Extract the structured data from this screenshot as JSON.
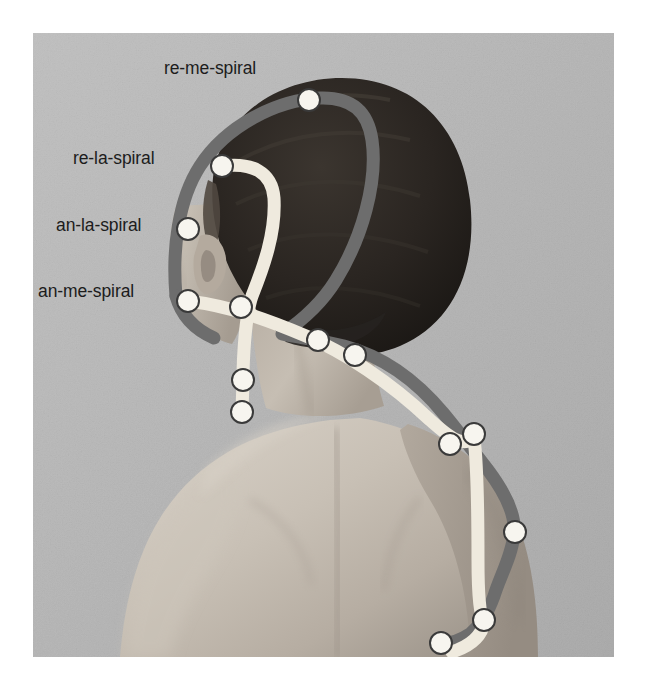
{
  "figure": {
    "kind": "annotated-photograph",
    "canvas": {
      "width": 647,
      "height": 687,
      "page_background": "#ffffff"
    },
    "photo": {
      "x": 33,
      "y": 33,
      "width": 581,
      "height": 624,
      "background_color": "#b9b9b9",
      "skin_color": "#c9c2b9",
      "hair_color": "#2a2622"
    },
    "labels": [
      {
        "id": "re-me-spiral",
        "text": "re-me-spiral",
        "x": 164,
        "y": 60,
        "anchor_dot": 0
      },
      {
        "id": "re-la-spiral",
        "text": "re-la-spiral",
        "x": 73,
        "y": 150,
        "anchor_dot": 1
      },
      {
        "id": "an-la-spiral",
        "text": "an-la-spiral",
        "x": 56,
        "y": 217,
        "anchor_dot": 2
      },
      {
        "id": "an-me-spiral",
        "text": "an-me-spiral",
        "x": 38,
        "y": 283,
        "anchor_dot": 3
      }
    ],
    "lines": [
      {
        "id": "dark-spiral-line",
        "color": "#6d6d6d",
        "width": 13,
        "note": "darker gray band looping over the head, down the neck and along the arm"
      },
      {
        "id": "light-spiral-line",
        "color": "#efeade",
        "width": 13,
        "note": "pale cream band from the crown, around the ear, across the neck and down the arm"
      }
    ],
    "dots": [
      {
        "id": "dot-re-me-spiral",
        "cx": 309,
        "cy": 100,
        "r": 11,
        "label": "re-me-spiral"
      },
      {
        "id": "dot-re-la-spiral",
        "cx": 222,
        "cy": 166,
        "r": 11,
        "label": "re-la-spiral"
      },
      {
        "id": "dot-an-la-spiral",
        "cx": 188,
        "cy": 229,
        "r": 11,
        "label": "an-la-spiral"
      },
      {
        "id": "dot-an-me-spiral",
        "cx": 188,
        "cy": 301,
        "r": 11,
        "label": "an-me-spiral"
      },
      {
        "id": "dot-jaw-upper",
        "cx": 241,
        "cy": 307,
        "r": 11,
        "label": ""
      },
      {
        "id": "dot-jaw-lower",
        "cx": 243,
        "cy": 380,
        "r": 11,
        "label": ""
      },
      {
        "id": "dot-clavicle",
        "cx": 242,
        "cy": 412,
        "r": 11,
        "label": ""
      },
      {
        "id": "dot-neck-left",
        "cx": 318,
        "cy": 340,
        "r": 11,
        "label": ""
      },
      {
        "id": "dot-neck-right",
        "cx": 355,
        "cy": 355,
        "r": 11,
        "label": ""
      },
      {
        "id": "dot-shoulder-in",
        "cx": 450,
        "cy": 444,
        "r": 11,
        "label": ""
      },
      {
        "id": "dot-shoulder-out",
        "cx": 474,
        "cy": 434,
        "r": 11,
        "label": ""
      },
      {
        "id": "dot-upper-arm",
        "cx": 515,
        "cy": 532,
        "r": 11,
        "label": ""
      },
      {
        "id": "dot-arm-lower",
        "cx": 484,
        "cy": 620,
        "r": 11,
        "label": ""
      },
      {
        "id": "dot-arm-bottom",
        "cx": 441,
        "cy": 643,
        "r": 11,
        "label": ""
      }
    ],
    "dot_style": {
      "fill": "#f7f5ef",
      "stroke": "#3a3a3a",
      "stroke_width": 2
    }
  }
}
